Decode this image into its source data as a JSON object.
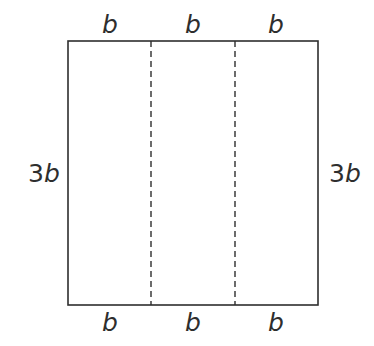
{
  "figure": {
    "kind": "rectangle-divided-into-three-equal-vertical-strips",
    "background_color": "#ffffff",
    "stroke_color": "#2e2e2e",
    "divider_color": "#2e2e2e",
    "outline": {
      "x": 68,
      "y": 41,
      "width": 250,
      "height": 264,
      "stroke_width": 1.6,
      "fill": "none"
    },
    "dividers": [
      {
        "name": "divider-left",
        "x": 151,
        "dash": "6 4",
        "stroke_width": 1.4
      },
      {
        "name": "divider-right",
        "x": 235,
        "dash": "6 4",
        "stroke_width": 1.4
      }
    ],
    "labels": {
      "top": [
        {
          "text": "b",
          "x": 110
        },
        {
          "text": "b",
          "x": 193
        },
        {
          "text": "b",
          "x": 276
        }
      ],
      "bottom": [
        {
          "text": "b",
          "x": 110
        },
        {
          "text": "b",
          "x": 193
        },
        {
          "text": "b",
          "x": 276
        }
      ],
      "left": {
        "number": "3",
        "variable": "b",
        "x": 44
      },
      "right": {
        "number": "3",
        "variable": "b",
        "x": 345
      }
    }
  },
  "chart_data": {
    "type": "diagram",
    "title": "",
    "shape": "rectangle",
    "segments_across_width": 3,
    "segment_label": "b",
    "total_width_expression": "3b",
    "height_label": "3b",
    "edge_labels": {
      "top": [
        "b",
        "b",
        "b"
      ],
      "bottom": [
        "b",
        "b",
        "b"
      ],
      "left": "3b",
      "right": "3b"
    }
  }
}
